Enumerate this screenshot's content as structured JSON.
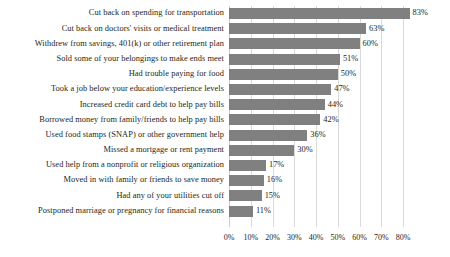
{
  "chart_data": {
    "type": "bar",
    "orientation": "horizontal",
    "title": "",
    "subtitle": "",
    "xlabel": "",
    "ylabel": "",
    "xlim": [
      0,
      85
    ],
    "axis_max_tick": 80,
    "grid": true,
    "legend": "none",
    "value_suffix": "%",
    "bar_color": "#808080",
    "gridline_color": "#d9d9d9",
    "text_color": "#231f20",
    "tick_labels": [
      "0%",
      "10%",
      "20%",
      "30%",
      "40%",
      "50%",
      "60%",
      "70%",
      "80%"
    ],
    "tick_values": [
      0,
      10,
      20,
      30,
      40,
      50,
      60,
      70,
      80
    ],
    "categories": [
      "Cut back on spending for transportation",
      "Cut back on doctors' visits or medical treatment",
      "Withdrew from savings, 401(k) or other retirement plan",
      "Sold some of your belongings to make ends meet",
      "Had trouble paying for food",
      "Took a job below your education/experience levels",
      "Increased credit card debt to help pay bills",
      "Borrowed money from family/friends to help pay bills",
      "Used food stamps (SNAP) or other government help",
      "Missed a mortgage or rent payment",
      "Used help from a nonprofit or religious organization",
      "Moved in with family or friends to save money",
      "Had any of your utilities cut off",
      "Postponed marriage or pregnancy for financial reasons"
    ],
    "values": [
      83,
      63,
      60,
      51,
      50,
      47,
      44,
      42,
      36,
      30,
      17,
      16,
      15,
      11
    ],
    "data_labels": [
      "83%",
      "63%",
      "60%",
      "51%",
      "50%",
      "47%",
      "44%",
      "42%",
      "36%",
      "30%",
      "17%",
      "16%",
      "15%",
      "11%"
    ]
  }
}
